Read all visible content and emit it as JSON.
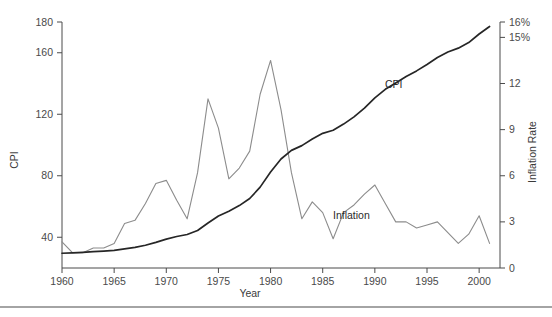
{
  "figure": {
    "ghost_title": "",
    "footer_rule": true
  },
  "chart_data": {
    "type": "line",
    "title": "",
    "xlabel": "Year",
    "ylabel": "CPI",
    "y2label": "Inflation Rate",
    "xlim": [
      1960,
      2002
    ],
    "ylim": [
      20,
      180
    ],
    "y2lim": [
      0,
      16
    ],
    "grid": false,
    "legend_position": "inline-annotation",
    "x_ticks": [
      1960,
      1965,
      1970,
      1975,
      1980,
      1985,
      1990,
      1995,
      2000
    ],
    "x_tick_labels": [
      "1960",
      "1965",
      "1970",
      "1975",
      "1980",
      "1985",
      "1990",
      "1995",
      "2000"
    ],
    "y_ticks": [
      40,
      80,
      120,
      160,
      180
    ],
    "y_tick_labels": [
      "40",
      "80",
      "120",
      "160",
      "180"
    ],
    "y2_ticks": [
      0,
      3,
      6,
      9,
      12,
      15,
      16
    ],
    "y2_tick_labels": [
      "0",
      "3",
      "6",
      "9",
      "12",
      "15%",
      "16%"
    ],
    "annotations": [
      {
        "text": "CPI",
        "x": 1990,
        "y_axis": "left",
        "y": 115
      },
      {
        "text": "Inflation",
        "x": 1987.5,
        "y_axis": "right",
        "y": 3.9
      }
    ],
    "series": [
      {
        "name": "CPI",
        "axis": "left",
        "color": "#262626",
        "x": [
          1960,
          1961,
          1962,
          1963,
          1964,
          1965,
          1966,
          1967,
          1968,
          1969,
          1970,
          1971,
          1972,
          1973,
          1974,
          1975,
          1976,
          1977,
          1978,
          1979,
          1980,
          1981,
          1982,
          1983,
          1984,
          1985,
          1986,
          1987,
          1988,
          1989,
          1990,
          1991,
          1992,
          1993,
          1994,
          1995,
          1996,
          1997,
          1998,
          1999,
          2000,
          2001
        ],
        "values": [
          29.6,
          29.9,
          30.2,
          30.6,
          31.0,
          31.5,
          32.4,
          33.4,
          34.8,
          36.7,
          38.8,
          40.5,
          41.8,
          44.4,
          49.3,
          53.8,
          56.9,
          60.6,
          65.2,
          72.6,
          82.4,
          90.9,
          96.5,
          99.6,
          103.9,
          107.6,
          109.6,
          113.6,
          118.3,
          124.0,
          130.7,
          136.2,
          140.3,
          144.5,
          148.2,
          152.4,
          156.9,
          160.5,
          163.0,
          166.6,
          172.2,
          177.1
        ]
      },
      {
        "name": "Inflation",
        "axis": "right",
        "color": "#8c8c8c",
        "x": [
          1960,
          1961,
          1962,
          1963,
          1964,
          1965,
          1966,
          1967,
          1968,
          1969,
          1970,
          1971,
          1972,
          1973,
          1974,
          1975,
          1976,
          1977,
          1978,
          1979,
          1980,
          1981,
          1982,
          1983,
          1984,
          1985,
          1986,
          1987,
          1988,
          1989,
          1990,
          1991,
          1992,
          1993,
          1994,
          1995,
          1996,
          1997,
          1998,
          1999,
          2000,
          2001
        ],
        "values": [
          1.7,
          1.0,
          1.0,
          1.3,
          1.3,
          1.6,
          2.9,
          3.1,
          4.2,
          5.5,
          5.7,
          4.4,
          3.2,
          6.2,
          11.0,
          9.1,
          5.8,
          6.5,
          7.6,
          11.3,
          13.5,
          10.3,
          6.2,
          3.2,
          4.3,
          3.6,
          1.9,
          3.6,
          4.1,
          4.8,
          5.4,
          4.2,
          3.0,
          3.0,
          2.6,
          2.8,
          3.0,
          2.3,
          1.6,
          2.2,
          3.4,
          1.6
        ]
      }
    ]
  }
}
